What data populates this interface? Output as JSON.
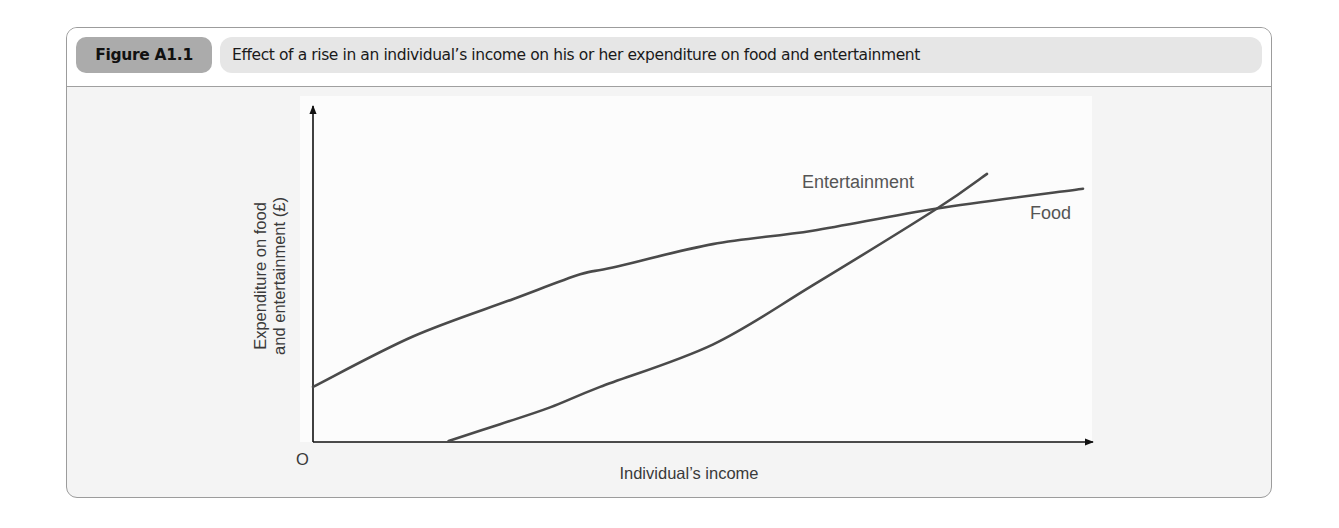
{
  "figure": {
    "label": "Figure A1.1",
    "title": "Effect of a rise in an individual’s income on his or her expenditure on food and entertainment"
  },
  "chart_data": {
    "type": "line",
    "title": "Effect of a rise in an individual’s income on his or her expenditure on food and entertainment",
    "xlabel": "Individual’s income",
    "ylabel_lines": [
      "Expenditure on food",
      "and entertainment (£)"
    ],
    "ylabel": "Expenditure on food and entertainment (£)",
    "origin_label": "O",
    "grid": false,
    "legend": "inline labels at line ends",
    "axis_ticks": "none (qualitative diagram)",
    "units": "relative positions, x and y in 0–100 scale of axis length",
    "xlim": [
      0,
      100
    ],
    "ylim": [
      0,
      100
    ],
    "series": [
      {
        "name": "Food",
        "label": "Food",
        "points": [
          [
            0,
            16.4
          ],
          [
            12.6,
            31.4
          ],
          [
            25.2,
            42.5
          ],
          [
            33.7,
            49.9
          ],
          [
            37.8,
            51.9
          ],
          [
            50.4,
            58.9
          ],
          [
            63.0,
            62.9
          ],
          [
            78.7,
            69.5
          ],
          [
            97.1,
            75.4
          ]
        ]
      },
      {
        "name": "Entertainment",
        "label": "Entertainment",
        "points": [
          [
            17.1,
            0.3
          ],
          [
            23.6,
            5.3
          ],
          [
            29.9,
            10.3
          ],
          [
            36.2,
            16.4
          ],
          [
            50.4,
            29.0
          ],
          [
            63.0,
            46.6
          ],
          [
            78.7,
            69.5
          ],
          [
            85.0,
            79.8
          ]
        ]
      }
    ]
  }
}
